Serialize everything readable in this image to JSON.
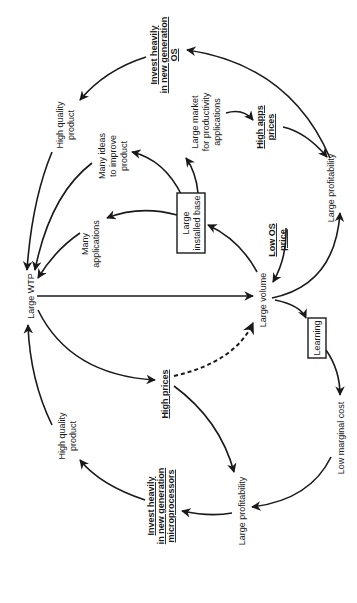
{
  "diagram": {
    "type": "causal-loop",
    "orientation": "rotated-90-ccw",
    "nodes": {
      "invest_os": {
        "lines": [
          "Invest heavily",
          "in new generation",
          "OS"
        ],
        "style": "bold-underline"
      },
      "hq_product_top": {
        "lines": [
          "High quality",
          "product"
        ],
        "style": "plain"
      },
      "many_ideas": {
        "lines": [
          "Many ideas",
          "to improve",
          "product"
        ],
        "style": "plain"
      },
      "large_market": {
        "lines": [
          "Large market",
          "for productivity",
          "applications"
        ],
        "style": "plain"
      },
      "high_apps_prices": {
        "lines": [
          "High apps",
          "prices"
        ],
        "style": "bold-underline"
      },
      "large_profitability_top": {
        "lines": [
          "Large profitability"
        ],
        "style": "plain"
      },
      "installed_base": {
        "lines": [
          "Large",
          "installed base"
        ],
        "style": "boxed"
      },
      "many_apps": {
        "lines": [
          "Many",
          "applications"
        ],
        "style": "plain"
      },
      "low_os_price": {
        "lines": [
          "Low OS",
          "price"
        ],
        "style": "bold-underline"
      },
      "large_wtp": {
        "lines": [
          "Large WTP"
        ],
        "style": "plain"
      },
      "large_volume": {
        "lines": [
          "Large volume"
        ],
        "style": "plain"
      },
      "learning": {
        "lines": [
          "Learning"
        ],
        "style": "boxed"
      },
      "high_prices": {
        "lines": [
          "High prices"
        ],
        "style": "bold-underline"
      },
      "hq_product_bottom": {
        "lines": [
          "High quality",
          "product"
        ],
        "style": "plain"
      },
      "low_marginal_cost": {
        "lines": [
          "Low marginal cost"
        ],
        "style": "plain"
      },
      "large_profitability_bottom": {
        "lines": [
          "Large profitability"
        ],
        "style": "plain"
      },
      "invest_micro": {
        "lines": [
          "Invest heavily",
          "in new generation",
          "microprocessors"
        ],
        "style": "bold-underline"
      }
    },
    "edges": [
      {
        "from": "Invest heavily in new generation OS",
        "to": "High quality product (top)",
        "style": "solid"
      },
      {
        "from": "High quality product (top)",
        "to": "Large WTP",
        "style": "solid"
      },
      {
        "from": "Many ideas to improve product",
        "to": "Large WTP",
        "style": "solid"
      },
      {
        "from": "Many applications",
        "to": "Large WTP",
        "style": "solid"
      },
      {
        "from": "Large installed base",
        "to": "Many applications",
        "style": "solid"
      },
      {
        "from": "Large installed base",
        "to": "Many ideas to improve product",
        "style": "solid"
      },
      {
        "from": "Large installed base",
        "to": "Large market for productivity applications",
        "style": "solid"
      },
      {
        "from": "Large market for productivity applications",
        "to": "High apps prices",
        "style": "solid"
      },
      {
        "from": "High apps prices",
        "to": "Large profitability (top)",
        "style": "solid"
      },
      {
        "from": "Large profitability (top)",
        "to": "Invest heavily in new generation OS",
        "style": "solid"
      },
      {
        "from": "Large volume",
        "to": "Large profitability (top)",
        "style": "solid"
      },
      {
        "from": "Large volume",
        "to": "Large installed base",
        "style": "solid"
      },
      {
        "from": "Low OS price",
        "to": "Large volume",
        "style": "solid"
      },
      {
        "from": "Large WTP",
        "to": "Large volume",
        "style": "solid"
      },
      {
        "from": "Large WTP",
        "to": "High prices",
        "style": "solid"
      },
      {
        "from": "High prices",
        "to": "Large volume",
        "style": "dashed"
      },
      {
        "from": "Large volume",
        "to": "Learning",
        "style": "solid"
      },
      {
        "from": "Learning",
        "to": "Low marginal cost",
        "style": "solid"
      },
      {
        "from": "Low marginal cost",
        "to": "Large profitability (bottom)",
        "style": "solid"
      },
      {
        "from": "High prices",
        "to": "Large profitability (bottom)",
        "style": "solid"
      },
      {
        "from": "Large profitability (bottom)",
        "to": "Invest heavily in new generation microprocessors",
        "style": "solid"
      },
      {
        "from": "Invest heavily in new generation microprocessors",
        "to": "High quality product (bottom)",
        "style": "solid"
      },
      {
        "from": "High quality product (bottom)",
        "to": "Large WTP",
        "style": "solid"
      }
    ]
  }
}
